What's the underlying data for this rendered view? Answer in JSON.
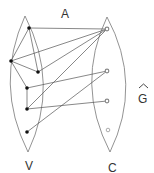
{
  "labels": {
    "top": "A",
    "left_set": "V",
    "right_set": "C",
    "graph": "G",
    "graph_accent": "^"
  },
  "colors": {
    "stroke": "#555555",
    "node_fill": "#111111",
    "right_node_fill": "#888888"
  },
  "left_nodes": [
    {
      "id": "v1",
      "x": 29,
      "y": 28
    },
    {
      "id": "v2",
      "x": 11,
      "y": 61
    },
    {
      "id": "v3",
      "x": 38,
      "y": 72
    },
    {
      "id": "v4",
      "x": 27,
      "y": 88
    },
    {
      "id": "v5",
      "x": 27,
      "y": 109
    },
    {
      "id": "v6",
      "x": 27,
      "y": 132
    }
  ],
  "right_nodes": [
    {
      "id": "c1",
      "x": 107,
      "y": 29
    },
    {
      "id": "c2",
      "x": 107,
      "y": 71
    },
    {
      "id": "c3",
      "x": 107,
      "y": 101
    },
    {
      "id": "c4",
      "x": 108,
      "y": 130,
      "hollow": true
    }
  ],
  "edges": [
    [
      "v1",
      "c1"
    ],
    [
      "v2",
      "c1"
    ],
    [
      "v3",
      "c1"
    ],
    [
      "v5",
      "c1"
    ],
    [
      "v4",
      "c2"
    ],
    [
      "v6",
      "c2"
    ],
    [
      "v5",
      "c3"
    ],
    [
      "v1",
      "v2"
    ],
    [
      "v1",
      "v3"
    ],
    [
      "v2",
      "v3"
    ],
    [
      "v2",
      "v4"
    ],
    [
      "v4",
      "v5"
    ]
  ]
}
